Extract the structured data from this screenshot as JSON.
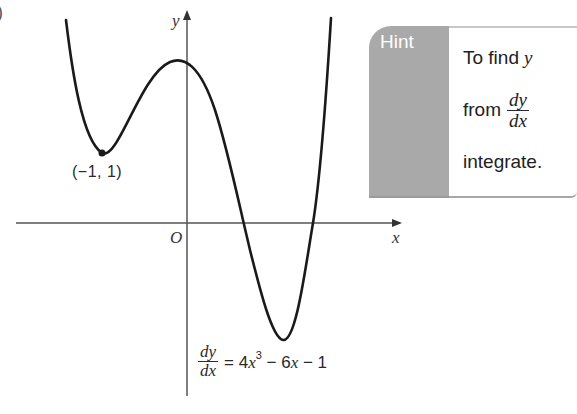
{
  "edge_fragment": ")",
  "graph": {
    "axes": {
      "x_label": "x",
      "y_label": "y",
      "origin_label": "O"
    },
    "curve": {
      "description": "Quartic curve with local minimum at (-1, 1), local maximum just left of y-axis, and deeper minimum right of y-axis",
      "stroke_color": "#1a1a1a"
    },
    "marked_point": {
      "label": "(−1, 1)",
      "x": -1,
      "y": 1
    },
    "equation": {
      "lhs_num": "dy",
      "lhs_den": "dx",
      "equals": "=",
      "coef1": "4",
      "var1": "x",
      "exp1": "3",
      "op1": " − 6",
      "var2": "x",
      "op2": " − 1"
    }
  },
  "hint": {
    "tab_label": "Hint",
    "line1_text": "To find",
    "line1_var": "y",
    "line2_text": "from",
    "line2_num": "dy",
    "line2_den": "dx",
    "line3_text": "integrate.",
    "tab_color": "#a9a9a9"
  }
}
